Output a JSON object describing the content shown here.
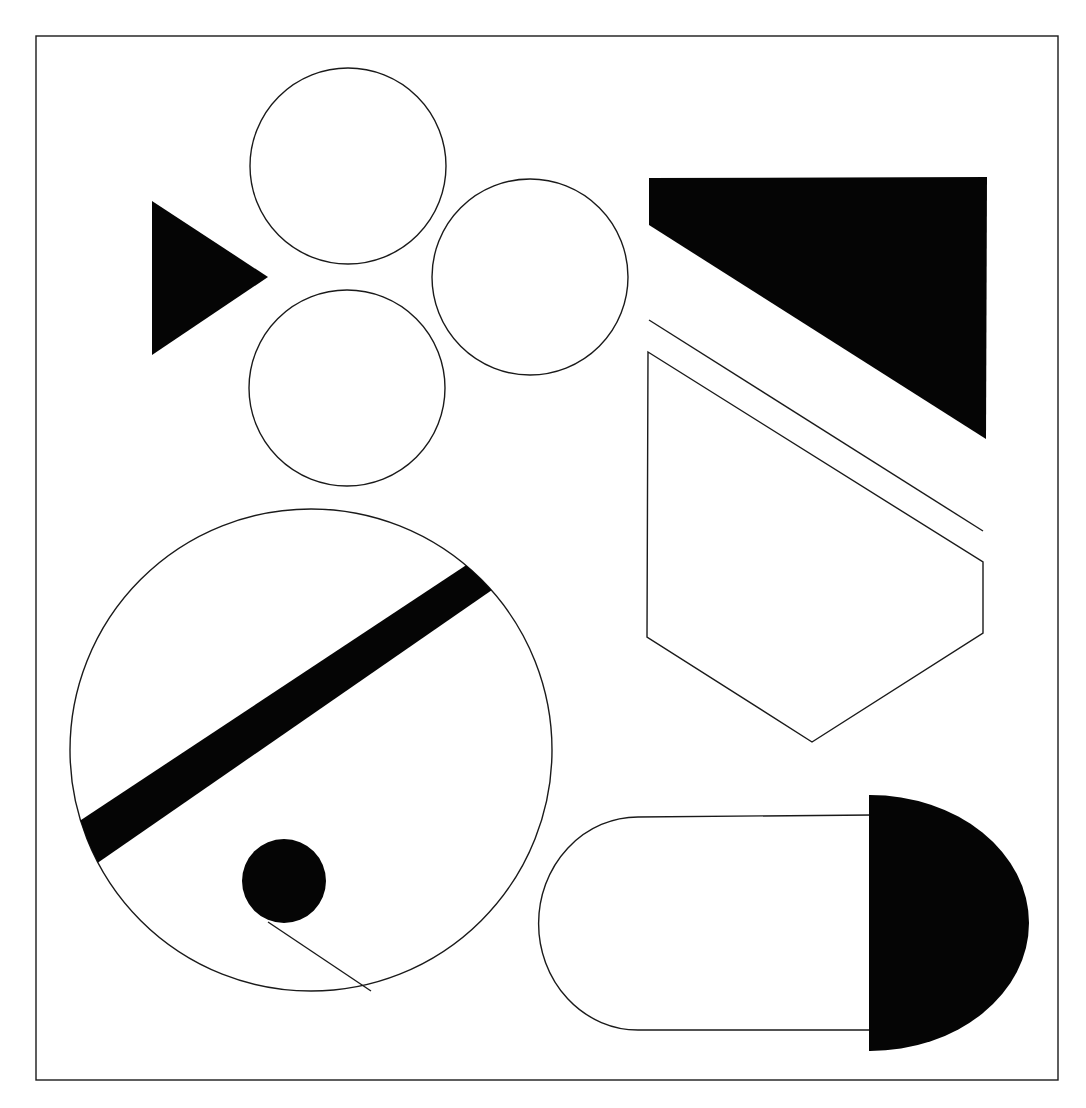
{
  "figure": {
    "width": 1086,
    "height": 1108,
    "background": "#ffffff",
    "ink": "#050505",
    "stroke": "#1a1a1a",
    "frame": {
      "x": 36,
      "y": 36,
      "w": 1022,
      "h": 1044
    },
    "shapes": [
      {
        "id": "filled-triangle",
        "type": "polygon",
        "fill": "solid",
        "points": "152,201 268,277 152,355"
      },
      {
        "id": "circle-top",
        "type": "circle",
        "fill": "none",
        "cx": 348,
        "cy": 166,
        "r": 98
      },
      {
        "id": "circle-right",
        "type": "circle",
        "fill": "none",
        "cx": 530,
        "cy": 277,
        "r": 98
      },
      {
        "id": "circle-bottom",
        "type": "circle",
        "fill": "none",
        "cx": 347,
        "cy": 388,
        "r": 98
      },
      {
        "id": "filled-trapezoid",
        "type": "polygon",
        "fill": "solid",
        "points": "649,178 987,177 986,439 649,225"
      },
      {
        "id": "diagonal-line",
        "type": "line",
        "x1": 649,
        "y1": 320,
        "x2": 983,
        "y2": 531
      },
      {
        "id": "pentagon-outline",
        "type": "polygon",
        "fill": "none",
        "points": "648,352 983,562 983,633 812,742 647,637"
      },
      {
        "id": "large-circle",
        "type": "circle",
        "fill": "none",
        "cx": 311,
        "cy": 750,
        "r": 241
      },
      {
        "id": "diagonal-band",
        "type": "polygon",
        "fill": "solid",
        "points": "78,822 480,556 505,581 96,864"
      },
      {
        "id": "small-dot",
        "type": "circle",
        "fill": "solid",
        "cx": 284,
        "cy": 881,
        "r": 42
      },
      {
        "id": "tangent-line",
        "type": "line",
        "x1": 268,
        "y1": 922,
        "x2": 371,
        "y2": 991
      },
      {
        "id": "capsule-outline",
        "type": "path",
        "fill": "none",
        "d": "M 872 815 L 638 817 A 98 105 0 0 0 638 1030 L 872 1030"
      },
      {
        "id": "filled-half-disk",
        "type": "path",
        "fill": "solid",
        "d": "M 869 795 L 870 795 A 159 128 0 0 1 870 1051 L 869 1051 Z"
      }
    ]
  }
}
